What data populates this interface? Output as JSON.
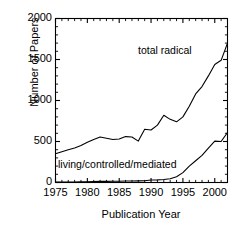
{
  "chart_data": {
    "type": "line",
    "title": "",
    "xlabel": "Publication Year",
    "ylabel": "Number of Papers",
    "xlim": [
      1975,
      2002
    ],
    "ylim": [
      0,
      2000
    ],
    "xticks": [
      1975,
      1980,
      1985,
      1990,
      1995,
      2000
    ],
    "yticks": [
      0,
      500,
      1000,
      1500,
      2000
    ],
    "xtick_labels": [
      "1975",
      "1980",
      "1985",
      "1990",
      "1995",
      "2000"
    ],
    "ytick_labels": [
      "0",
      "500",
      "1000",
      "1500",
      "2000"
    ],
    "minor_ticks": true,
    "grid": false,
    "legend_position": "inline-annotations",
    "x": [
      1975,
      1976,
      1977,
      1978,
      1979,
      1980,
      1981,
      1982,
      1983,
      1984,
      1985,
      1986,
      1987,
      1988,
      1989,
      1990,
      1991,
      1992,
      1993,
      1994,
      1995,
      1996,
      1997,
      1998,
      1999,
      2000,
      2001,
      2002
    ],
    "series": [
      {
        "name": "total radical",
        "label": "total radical",
        "color": "#000000",
        "values": [
          350,
          375,
          400,
          420,
          450,
          490,
          525,
          555,
          540,
          525,
          530,
          560,
          555,
          505,
          650,
          640,
          700,
          820,
          770,
          740,
          800,
          930,
          1080,
          1170,
          1300,
          1440,
          1490,
          1700
        ]
      },
      {
        "name": "living/controlled/mediated",
        "label": "living/controlled/mediated",
        "color": "#000000",
        "values": [
          5,
          6,
          6,
          7,
          8,
          10,
          12,
          14,
          14,
          15,
          16,
          18,
          18,
          20,
          22,
          30,
          32,
          36,
          45,
          70,
          120,
          200,
          265,
          330,
          420,
          505,
          500,
          610
        ]
      }
    ],
    "annotations": [
      {
        "text": "total radical",
        "x": 1994,
        "y": 1620
      },
      {
        "text": "living/controlled/mediated",
        "x": 1976,
        "y": 215
      }
    ]
  }
}
